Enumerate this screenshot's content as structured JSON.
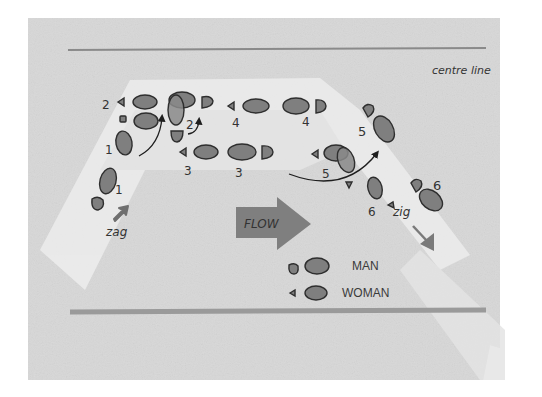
{
  "diagram": {
    "title_label": "centre line",
    "flow_label": "FLOW",
    "zag_label": "zag",
    "zig_label": "zig",
    "legend": [
      {
        "label": "MAN",
        "role": "man"
      },
      {
        "label": "WOMAN",
        "role": "woman"
      }
    ],
    "step_numbers": {
      "man": [
        "1",
        "1",
        "2",
        "2",
        "3",
        "3",
        "4",
        "4",
        "5",
        "5",
        "6",
        "6"
      ]
    },
    "colors": {
      "paper": "#d9d9d9",
      "strip": "#ececec",
      "foot_fill": "#7f7f7f",
      "foot_stroke": "#2e2e2e",
      "flow_arrow": "#7a7a7a",
      "centre_line": "#8a8a8a",
      "wall_line": "#9a9a9a"
    }
  }
}
